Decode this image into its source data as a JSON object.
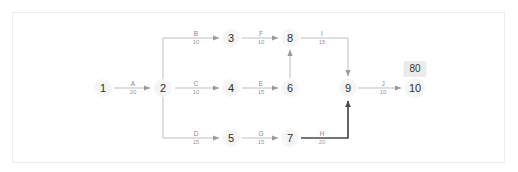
{
  "diagram": {
    "type": "activity-on-arrow-network",
    "colors": {
      "background": "#ffffff",
      "frame_border": "#ececec",
      "edge_line": "#b8b8b8",
      "critical_path_line": "#4a4a4a",
      "node_text": "#2f2f2f",
      "label_text": "#8d8d8d",
      "badge_background": "#ebebeb",
      "badge_text": "#3a3a3a"
    },
    "nodes": [
      {
        "id": "n1",
        "label": "1",
        "x": 103,
        "y": 88
      },
      {
        "id": "n2",
        "label": "2",
        "x": 163,
        "y": 88
      },
      {
        "id": "n3",
        "label": "3",
        "x": 231,
        "y": 38
      },
      {
        "id": "n4",
        "label": "4",
        "x": 231,
        "y": 88
      },
      {
        "id": "n5",
        "label": "5",
        "x": 231,
        "y": 138
      },
      {
        "id": "n6",
        "label": "6",
        "x": 290,
        "y": 88
      },
      {
        "id": "n7",
        "label": "7",
        "x": 290,
        "y": 138
      },
      {
        "id": "n8",
        "label": "8",
        "x": 290,
        "y": 38
      },
      {
        "id": "n9",
        "label": "9",
        "x": 348,
        "y": 88
      },
      {
        "id": "n10",
        "label": "10",
        "x": 415,
        "y": 88
      }
    ],
    "edges": [
      {
        "id": "A",
        "activity": "A",
        "duration": "20",
        "from": "1",
        "to": "2",
        "label_x": 133,
        "label_y": 88
      },
      {
        "id": "B",
        "activity": "B",
        "duration": "10",
        "from": "2",
        "to": "3",
        "label_x": 196,
        "label_y": 38
      },
      {
        "id": "C",
        "activity": "C",
        "duration": "10",
        "from": "2",
        "to": "4",
        "label_x": 196,
        "label_y": 88
      },
      {
        "id": "D",
        "activity": "D",
        "duration": "15",
        "from": "2",
        "to": "5",
        "label_x": 196,
        "label_y": 138
      },
      {
        "id": "F",
        "activity": "F",
        "duration": "10",
        "from": "3",
        "to": "8",
        "label_x": 261,
        "label_y": 38
      },
      {
        "id": "E",
        "activity": "E",
        "duration": "15",
        "from": "4",
        "to": "6",
        "label_x": 261,
        "label_y": 88
      },
      {
        "id": "G",
        "activity": "G",
        "duration": "15",
        "from": "5",
        "to": "7",
        "label_x": 261,
        "label_y": 138
      },
      {
        "id": "I",
        "activity": "I",
        "duration": "15",
        "from": "8",
        "to": "9",
        "label_x": 322,
        "label_y": 38
      },
      {
        "id": "H",
        "activity": "H",
        "duration": "20",
        "from": "7",
        "to": "9",
        "label_x": 322,
        "label_y": 138,
        "critical": true
      },
      {
        "id": "J",
        "activity": "J",
        "duration": "10",
        "from": "9",
        "to": "10",
        "label_x": 383,
        "label_y": 88
      },
      {
        "id": "dummy-6-8",
        "activity": "",
        "duration": "",
        "from": "6",
        "to": "8"
      }
    ],
    "badge": {
      "value": "80",
      "x": 415,
      "y": 69
    }
  }
}
